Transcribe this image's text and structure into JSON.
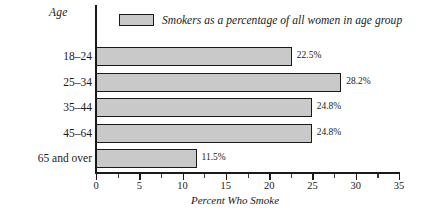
{
  "chart_data": {
    "type": "bar",
    "orientation": "horizontal",
    "title": "",
    "xlabel": "Percent Who Smoke",
    "ylabel": "Age",
    "categories": [
      "18–24",
      "25–34",
      "35–44",
      "45–64",
      "65 and over"
    ],
    "values": [
      22.5,
      28.2,
      24.8,
      24.8,
      11.5
    ],
    "value_labels": [
      "22.5%",
      "28.2%",
      "24.8%",
      "24.8%",
      "11.5%"
    ],
    "series": [
      {
        "name": "Smokers as a percentage of all women in age group",
        "values": [
          22.5,
          28.2,
          24.8,
          24.8,
          11.5
        ]
      }
    ],
    "xlim": [
      0,
      35
    ],
    "xticks": [
      0,
      5,
      10,
      15,
      20,
      25,
      30,
      35
    ],
    "xtick_labels": [
      "0",
      "5",
      "10",
      "15",
      "20",
      "25",
      "30",
      "35"
    ],
    "minor_tick_step": 2.5,
    "grid": false,
    "legend_position": "top",
    "legend": [
      "Smokers as a percentage of all women in age group"
    ],
    "bar_fill_color": "#c9c9c9",
    "bar_border_color": "#1a1a1a",
    "axis_color": "#1a1a1a"
  },
  "legend": {
    "label": "Smokers as a percentage of all women in age group",
    "swatch_name": "legend-swatch"
  },
  "axes": {
    "y_caption": "Age",
    "x_title": "Percent Who Smoke"
  }
}
